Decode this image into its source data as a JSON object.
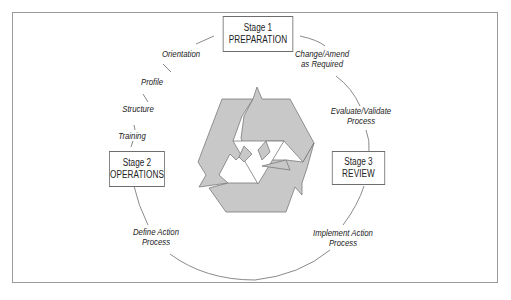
{
  "diagram": {
    "type": "cycle",
    "center_icon": "recycle-icon",
    "colors": {
      "frame_border": "#9a9a9a",
      "circle_stroke": "#8a8a8a",
      "recycle_fill": "#c8c8c8",
      "recycle_stroke": "#7a7a7a",
      "text": "#222222"
    },
    "stages": [
      {
        "number_label": "Stage 1",
        "name": "PREPARATION"
      },
      {
        "number_label": "Stage 2",
        "name": "OPERATIONS"
      },
      {
        "number_label": "Stage 3",
        "name": "REVIEW"
      }
    ],
    "steps": {
      "orientation": "Orientation",
      "profile": "Profile",
      "structure": "Structure",
      "training": "Training",
      "change_amend_1": "Change/Amend",
      "change_amend_2": "as Required",
      "evaluate_1": "Evaluate/Validate",
      "evaluate_2": "Process",
      "implement_1": "Implement Action",
      "implement_2": "Process",
      "define_1": "Define Action",
      "define_2": "Process"
    }
  }
}
